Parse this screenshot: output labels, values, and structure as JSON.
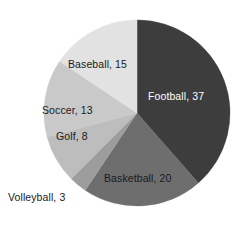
{
  "chart_data": {
    "type": "pie",
    "title": "",
    "categories": [
      "Football",
      "Basketball",
      "Volleyball",
      "Golf",
      "Soccer",
      "Baseball"
    ],
    "values": [
      37,
      20,
      3,
      8,
      13,
      15
    ],
    "total": 96,
    "start_angle_deg": 0,
    "direction": "clockwise",
    "legend": "none",
    "grid": false,
    "labels": [
      {
        "text": "Football, 37",
        "category": "Football",
        "value": 37,
        "color": "#3d3d3d",
        "text_color": "#ffffff"
      },
      {
        "text": "Basketball, 20",
        "category": "Basketball",
        "value": 20,
        "color": "#6e6e6e",
        "text_color": "#1a1a1a"
      },
      {
        "text": "Volleyball, 3",
        "category": "Volleyball",
        "value": 3,
        "color": "#9d9d9d",
        "text_color": "#1a1a1a"
      },
      {
        "text": "Golf, 8",
        "category": "Golf",
        "value": 8,
        "color": "#bdbdbd",
        "text_color": "#1a1a1a"
      },
      {
        "text": "Soccer, 13",
        "category": "Soccer",
        "value": 13,
        "color": "#c9c9c9",
        "text_color": "#1a1a1a"
      },
      {
        "text": "Baseball, 15",
        "category": "Baseball",
        "value": 15,
        "color": "#e2e2e2",
        "text_color": "#1a1a1a"
      }
    ],
    "geometry": {
      "center_x": 137,
      "center_y": 113,
      "radius": 93
    }
  }
}
